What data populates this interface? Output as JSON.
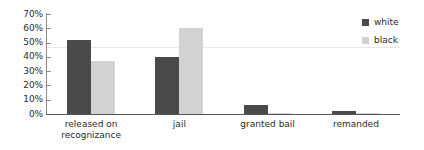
{
  "chart_data": {
    "type": "bar",
    "title": "",
    "subtitle": "",
    "xlabel": "",
    "ylabel": "",
    "categories": [
      "released on\nrecognizance",
      "jail",
      "granted bail",
      "remanded"
    ],
    "series": [
      {
        "name": "white",
        "color": "#4a4a4a",
        "values": [
          52,
          40,
          6,
          2
        ]
      },
      {
        "name": "black",
        "color": "#d2d2d2",
        "values": [
          37,
          60,
          1,
          1
        ]
      }
    ],
    "ylim": [
      0,
      70
    ],
    "ytick_values": [
      70,
      60,
      50,
      40,
      30,
      20,
      10,
      0
    ],
    "ytick_labels": [
      "70%",
      "60%",
      "50%",
      "40%",
      "30%",
      "20%",
      "10%",
      "0%"
    ],
    "grid": true,
    "gridline_values": [
      47
    ],
    "legend_position": "right-top",
    "value_suffix": "%"
  },
  "legend": {
    "entries": [
      {
        "label": "white",
        "color": "#4a4a4a"
      },
      {
        "label": "black",
        "color": "#d2d2d2"
      }
    ]
  },
  "axis_colors": {
    "axis_line": "#8d8d8d",
    "baseline": "#555555",
    "gridline": "#e8e8e8",
    "tick_text": "#2b2b2b"
  }
}
